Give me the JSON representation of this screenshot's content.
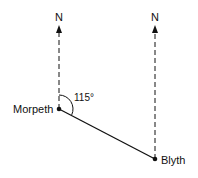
{
  "diagram": {
    "type": "bearing",
    "points": [
      {
        "id": "morpeth",
        "label": "Morpeth",
        "x": 59,
        "y": 109
      },
      {
        "id": "blyth",
        "label": "Blyth",
        "x": 155,
        "y": 159
      }
    ],
    "north_label": "N",
    "angle_label": "115°",
    "bearing_degrees": 115,
    "colors": {
      "ink": "#111111",
      "background": "#ffffff"
    }
  }
}
